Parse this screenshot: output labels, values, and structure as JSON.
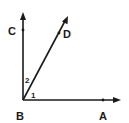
{
  "diagram": {
    "type": "angle-geometry",
    "vertex": {
      "label": "B",
      "x": 23,
      "y": 100
    },
    "rays": [
      {
        "name": "BC",
        "point_label": "C",
        "direction": "up"
      },
      {
        "name": "BD",
        "point_label": "D",
        "direction": "up-right"
      },
      {
        "name": "BA",
        "point_label": "A",
        "direction": "right"
      }
    ],
    "points": {
      "A": "A",
      "B": "B",
      "C": "C",
      "D": "D"
    },
    "angles": {
      "angle_1": "1",
      "angle_2": "2"
    },
    "colors": {
      "stroke": "#1a1a1a",
      "background": "#ffffff"
    }
  }
}
